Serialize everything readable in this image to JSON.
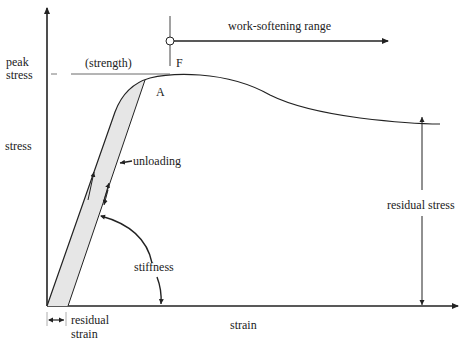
{
  "diagram": {
    "axes": {
      "y_label": "stress",
      "x_label": "strain"
    },
    "labels": {
      "peak_stress_line1": "peak",
      "peak_stress_line2": "stress",
      "strength": "(strength)",
      "point_f": "F",
      "point_a": "A",
      "work_softening": "work-softening range",
      "unloading": "unloading",
      "stiffness": "stiffness",
      "residual_stress": "residual stress",
      "residual_strain_line1": "residual",
      "residual_strain_line2": "strain"
    },
    "colors": {
      "line": "#222222",
      "shaded_band": "#e6e6e6"
    }
  }
}
